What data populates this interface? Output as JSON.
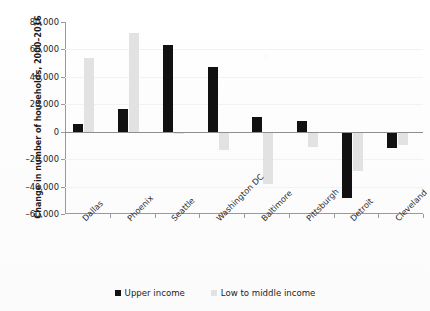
{
  "chart_data": {
    "type": "bar",
    "title": "",
    "xlabel": "",
    "ylabel": "Change in number of households, 2000–2016",
    "ylim": [
      -60000,
      80000
    ],
    "ytick_step": 20000,
    "yticks": [
      "80,000",
      "60,000",
      "40,000",
      "20,000",
      "0",
      "–20,000",
      "–40,000",
      "–60,000"
    ],
    "ytick_values": [
      80000,
      60000,
      40000,
      20000,
      0,
      -20000,
      -40000,
      -60000
    ],
    "grid": false,
    "legend_position": "bottom",
    "categories": [
      "Dallas",
      "Phoenix",
      "Seattle",
      "Washington DC",
      "Baltimore",
      "Pittsburgh",
      "Detroit",
      "Cleveland"
    ],
    "series": [
      {
        "name": "Upper income",
        "color": "#111111",
        "values": [
          5500,
          16500,
          63500,
          47000,
          11000,
          8000,
          -48000,
          -12000
        ]
      },
      {
        "name": "Low to middle income",
        "color": "#e2e2e2",
        "values": [
          54000,
          72000,
          -2000,
          -13000,
          -38000,
          -11000,
          -29000,
          -9500
        ]
      }
    ]
  },
  "legend": {
    "items": [
      {
        "label": "Upper income",
        "swatch": "upper"
      },
      {
        "label": "Low to middle income",
        "swatch": "lowmid"
      }
    ]
  }
}
